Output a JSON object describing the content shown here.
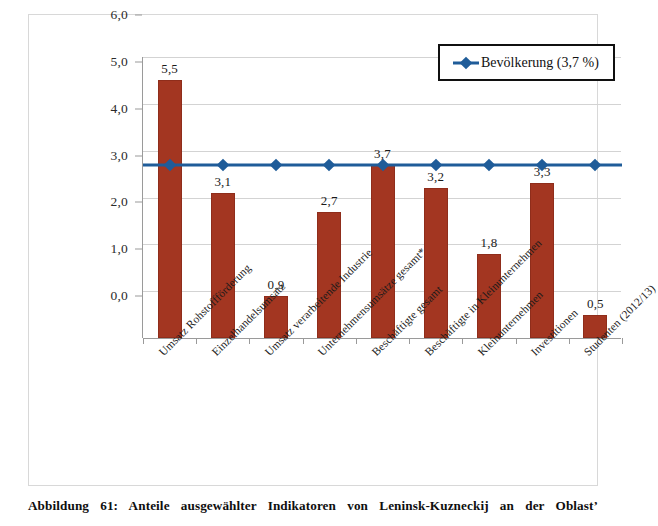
{
  "chart_data": {
    "type": "bar",
    "title": "",
    "xlabel": "",
    "ylabel": "",
    "ylim": [
      0,
      6
    ],
    "ytick_step": 1,
    "grid": true,
    "legend_position": "top-right",
    "categories": [
      "Umsatz Rohstoffförderung",
      "Einzelhandelsumsatz",
      "Umsatz verarbeitende Industrie",
      "Unternehmensumsätze gesamt*",
      "Beschäftigte gesamt",
      "Beschäftigte in Kleinunternehmen",
      "Kleinunternehmen",
      "Investitionen",
      "Studenten (2012/13)"
    ],
    "ytick_labels": [
      "0,0",
      "1,0",
      "2,0",
      "3,0",
      "4,0",
      "5,0",
      "6,0"
    ],
    "ytick_values": [
      0,
      1,
      2,
      3,
      4,
      5,
      6
    ],
    "series": [
      {
        "name": "Anteil",
        "kind": "bar",
        "color": "#A33621",
        "values": [
          5.5,
          3.1,
          0.9,
          2.7,
          3.7,
          3.2,
          1.8,
          3.3,
          0.5
        ],
        "data_labels": [
          "5,5",
          "3,1",
          "0,9",
          "2,7",
          "3,7",
          "3,2",
          "1,8",
          "3,3",
          "0,5"
        ]
      },
      {
        "name": "Bevölkerung (3,7 %)",
        "kind": "line",
        "color": "#1F5C99",
        "marker": "diamond",
        "constant_value": 3.7,
        "values": [
          3.7,
          3.7,
          3.7,
          3.7,
          3.7,
          3.7,
          3.7,
          3.7,
          3.7
        ]
      }
    ]
  },
  "legend": {
    "entries": [
      {
        "label": "Bevölkerung (3,7 %)",
        "color": "#1F5C99",
        "marker": "diamond"
      }
    ]
  },
  "caption": {
    "text": "Abbildung 61: Anteile ausgewählter Indikatoren von Leninsk-Kuzneckij an der Oblast’"
  },
  "colors": {
    "bar": "#A33621",
    "line": "#1F5C99",
    "grid": "#D3D3D3",
    "axis": "#9A9A9A",
    "frame": "#D8D8D8"
  }
}
